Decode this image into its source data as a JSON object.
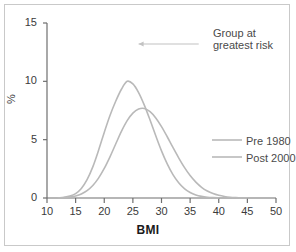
{
  "chart_data": {
    "type": "line",
    "title": "",
    "xlabel": "BMI",
    "ylabel": "%",
    "xlim": [
      10,
      50
    ],
    "ylim": [
      0,
      15
    ],
    "xticks": [
      10,
      15,
      20,
      25,
      30,
      35,
      40,
      45,
      50
    ],
    "yticks": [
      0,
      5,
      10,
      15
    ],
    "grid": false,
    "legend_position": "right-middle",
    "series": [
      {
        "name": "Pre 1980",
        "color": "#b9b9b9",
        "peak_x": 24,
        "peak_y": 10.0,
        "sigma": 3.6,
        "points": [
          {
            "x": 12,
            "y": 0.02
          },
          {
            "x": 13,
            "y": 0.06
          },
          {
            "x": 14,
            "y": 0.16
          },
          {
            "x": 15,
            "y": 0.38
          },
          {
            "x": 16,
            "y": 0.82
          },
          {
            "x": 17,
            "y": 1.57
          },
          {
            "x": 18,
            "y": 2.67
          },
          {
            "x": 19,
            "y": 4.08
          },
          {
            "x": 20,
            "y": 5.62
          },
          {
            "x": 21,
            "y": 7.07
          },
          {
            "x": 22,
            "y": 8.29
          },
          {
            "x": 23,
            "y": 9.32
          },
          {
            "x": 24,
            "y": 10.0
          },
          {
            "x": 25,
            "y": 9.78
          },
          {
            "x": 26,
            "y": 9.04
          },
          {
            "x": 27,
            "y": 7.96
          },
          {
            "x": 28,
            "y": 6.68
          },
          {
            "x": 29,
            "y": 5.33
          },
          {
            "x": 30,
            "y": 4.04
          },
          {
            "x": 31,
            "y": 2.92
          },
          {
            "x": 32,
            "y": 2.0
          },
          {
            "x": 33,
            "y": 1.3
          },
          {
            "x": 34,
            "y": 0.8
          },
          {
            "x": 35,
            "y": 0.47
          },
          {
            "x": 36,
            "y": 0.26
          },
          {
            "x": 37,
            "y": 0.14
          },
          {
            "x": 38,
            "y": 0.07
          },
          {
            "x": 39,
            "y": 0.03
          },
          {
            "x": 40,
            "y": 0.01
          }
        ]
      },
      {
        "name": "Post 2000",
        "color": "#b9b9b9",
        "peak_x": 26.5,
        "peak_y": 7.7,
        "sigma": 4.8,
        "points": [
          {
            "x": 13,
            "y": 0.04
          },
          {
            "x": 14,
            "y": 0.09
          },
          {
            "x": 15,
            "y": 0.18
          },
          {
            "x": 16,
            "y": 0.35
          },
          {
            "x": 17,
            "y": 0.63
          },
          {
            "x": 18,
            "y": 1.07
          },
          {
            "x": 19,
            "y": 1.7
          },
          {
            "x": 20,
            "y": 2.53
          },
          {
            "x": 21,
            "y": 3.53
          },
          {
            "x": 22,
            "y": 4.63
          },
          {
            "x": 23,
            "y": 5.71
          },
          {
            "x": 24,
            "y": 6.63
          },
          {
            "x": 25,
            "y": 7.27
          },
          {
            "x": 26,
            "y": 7.62
          },
          {
            "x": 27,
            "y": 7.67
          },
          {
            "x": 28,
            "y": 7.4
          },
          {
            "x": 29,
            "y": 6.86
          },
          {
            "x": 30,
            "y": 6.12
          },
          {
            "x": 31,
            "y": 5.25
          },
          {
            "x": 32,
            "y": 4.33
          },
          {
            "x": 33,
            "y": 3.44
          },
          {
            "x": 34,
            "y": 2.62
          },
          {
            "x": 35,
            "y": 1.92
          },
          {
            "x": 36,
            "y": 1.36
          },
          {
            "x": 37,
            "y": 0.92
          },
          {
            "x": 38,
            "y": 0.6
          },
          {
            "x": 39,
            "y": 0.38
          },
          {
            "x": 40,
            "y": 0.23
          },
          {
            "x": 41,
            "y": 0.13
          },
          {
            "x": 42,
            "y": 0.07
          },
          {
            "x": 43,
            "y": 0.04
          },
          {
            "x": 44,
            "y": 0.02
          },
          {
            "x": 45,
            "y": 0.01
          }
        ]
      }
    ],
    "annotations": [
      {
        "text_line1": "Group at",
        "text_line2": "greatest risk",
        "arrow_from_x": 36.5,
        "arrow_to_x": 26.0,
        "arrow_y": 13.2
      }
    ]
  },
  "axes": {
    "y_tick_labels": [
      "15",
      "10",
      "5",
      "0"
    ],
    "x_tick_labels": [
      "10",
      "15",
      "20",
      "25",
      "30",
      "35",
      "40",
      "45",
      "50"
    ],
    "ylabel": "%",
    "xlabel": "BMI"
  },
  "legend": {
    "entries": [
      {
        "label": "Pre 1980"
      },
      {
        "label": "Post 2000"
      }
    ]
  },
  "annotation": {
    "line1": "Group at",
    "line2": "greatest risk"
  },
  "colors": {
    "curve": "#b9b9b9",
    "axis": "#6f6f6f",
    "text": "#3b3b3b",
    "frame": "#c9c9c9",
    "annotation_text": "#4a4a4a"
  }
}
